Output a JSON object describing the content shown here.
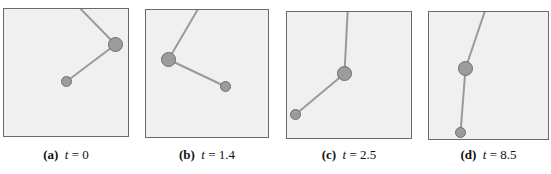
{
  "figure": {
    "panels": [
      {
        "label": "(a)",
        "var": "t",
        "eq": "=",
        "value": "0",
        "box": [
          3,
          8,
          126,
          129
        ],
        "pivot": [
          67,
          0
        ],
        "bob1": [
          116,
          45
        ],
        "bob2": [
          67,
          82
        ]
      },
      {
        "label": "(b)",
        "var": "t",
        "eq": "=",
        "value": "1.4",
        "box": [
          145,
          9,
          124,
          129
        ],
        "pivot": [
          207,
          0
        ],
        "bob1": [
          169,
          60
        ],
        "bob2": [
          226,
          87
        ]
      },
      {
        "label": "(c)",
        "var": "t",
        "eq": "=",
        "value": "2.5",
        "box": [
          286,
          11,
          126,
          128
        ],
        "pivot": [
          349,
          0
        ],
        "bob1": [
          345,
          74
        ],
        "bob2": [
          296,
          115
        ]
      },
      {
        "label": "(d)",
        "var": "t",
        "eq": "=",
        "value": "8.5",
        "box": [
          428,
          11,
          121,
          129
        ],
        "pivot": [
          491,
          0
        ],
        "bob1": [
          466,
          69
        ],
        "bob2": [
          461,
          133
        ]
      }
    ],
    "colors": {
      "background": "#f0f0f0",
      "border": "#6a6a6a",
      "rod": "#9a9a9a",
      "bob_fill": "#9c9c9c",
      "bob_stroke": "#6e6e6e"
    },
    "bob1_radius": 7,
    "bob2_radius": 5
  }
}
